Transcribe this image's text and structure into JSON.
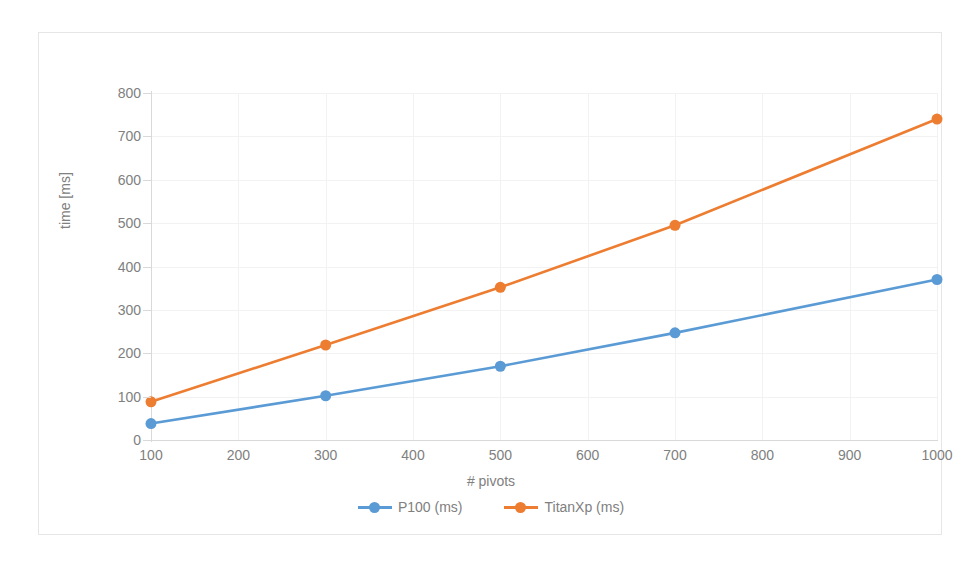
{
  "chart_data": {
    "type": "line",
    "title": "",
    "xlabel": "# pivots",
    "ylabel": "time [ms]",
    "x": [
      100,
      300,
      500,
      700,
      1000
    ],
    "series": [
      {
        "name": "P100 (ms)",
        "color": "#5B9BD5",
        "values": [
          38,
          102,
          170,
          247,
          370
        ]
      },
      {
        "name": "TitanXp (ms)",
        "color": "#ED7D31",
        "values": [
          88,
          219,
          352,
          495,
          740
        ]
      }
    ],
    "xlim": [
      100,
      1000
    ],
    "ylim": [
      0,
      800
    ],
    "xticks": [
      100,
      200,
      300,
      400,
      500,
      600,
      700,
      800,
      900,
      1000
    ],
    "yticks": [
      0,
      100,
      200,
      300,
      400,
      500,
      600,
      700,
      800
    ],
    "xtick_labels": [
      "100",
      "200",
      "300",
      "400",
      "500",
      "600",
      "700",
      "800",
      "900",
      "1000"
    ],
    "ytick_labels": [
      "0",
      "100",
      "200",
      "300",
      "400",
      "500",
      "600",
      "700",
      "800"
    ],
    "grid": true,
    "legend_position": "bottom",
    "marker": "circle"
  },
  "legend": {
    "entries": [
      {
        "label": "P100 (ms)",
        "color": "#5B9BD5"
      },
      {
        "label": "TitanXp (ms)",
        "color": "#ED7D31"
      }
    ]
  },
  "axes": {
    "x_title": "# pivots",
    "y_title": "time [ms]"
  },
  "colors": {
    "series_blue": "#5B9BD5",
    "series_orange": "#ED7D31",
    "gridline": "#F2F2F2",
    "axis_line": "#D9D9D9",
    "tick_text": "#808080",
    "chart_border": "#E6E6E6",
    "background": "#FFFFFF"
  }
}
